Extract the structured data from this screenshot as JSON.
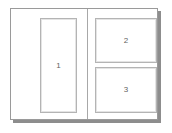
{
  "diagram": {
    "colors": {
      "background": "#ffffff",
      "frame_border": "#9a9a9a",
      "pane_border": "#b4b4b4",
      "divider": "#a8a8a8",
      "shadow": "#8d8d8d",
      "label_text": "#5f5f5f"
    },
    "panes": [
      {
        "id": "pane-1",
        "label": "1",
        "region": "left-column"
      },
      {
        "id": "pane-2",
        "label": "2",
        "region": "right-column-top"
      },
      {
        "id": "pane-3",
        "label": "3",
        "region": "right-column-bottom"
      }
    ]
  }
}
